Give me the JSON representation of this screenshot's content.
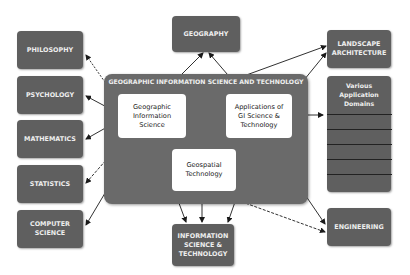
{
  "diagram": {
    "core": {
      "title": "GEOGRAPHIC INFORMATION SCIENCE AND TECHNOLOGY",
      "nodes": {
        "gis": "Geographic\nInformation\nScience",
        "applications": "Applications of\nGI Science &\nTechnology",
        "geospatial": "Geospatial\nTechnology"
      }
    },
    "left_disciplines": [
      {
        "label": "PHILOSOPHY"
      },
      {
        "label": "PSYCHOLOGY"
      },
      {
        "label": "MATHEMATICS"
      },
      {
        "label": "STATISTICS"
      },
      {
        "label": "COMPUTER\nSCIENCE"
      }
    ],
    "top": {
      "label": "GEOGRAPHY"
    },
    "bottom": {
      "label": "INFORMATION\nSCIENCE &\nTECHNOLOGY"
    },
    "right": {
      "landscape": "LANDSCAPE\nARCHITECTURE",
      "domains": "Various\nApplication\nDomains",
      "engineering": "ENGINEERING"
    },
    "colors": {
      "box": "#5f5f5f",
      "core": "#6a6a6a",
      "inner": "#ffffff",
      "arrow": "#1a1a1a"
    }
  }
}
